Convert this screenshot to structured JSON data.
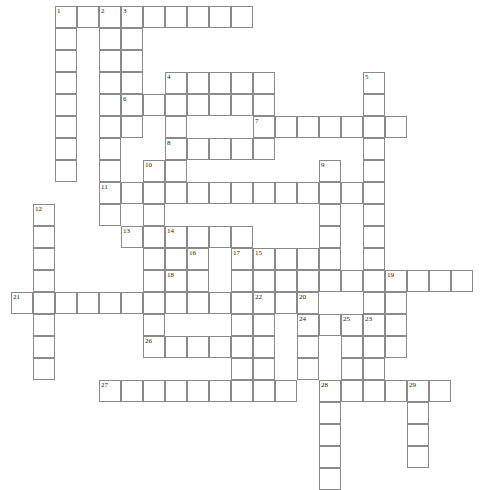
{
  "puzzle": {
    "title": "Crossword Puzzle Grid",
    "type": "crossword-grid",
    "grid": {
      "cell_size": 22,
      "origin_x": 11,
      "origin_y": 6,
      "columns": 22,
      "rows": 21,
      "border_color": "#8a8a8a",
      "cell_color": "#ffffff",
      "number_color": "#1a1a1a"
    },
    "entries": [
      {
        "number": 1,
        "direction": "down",
        "col": 2,
        "row": 0,
        "length": 8
      },
      {
        "number": 2,
        "direction": "down",
        "col": 4,
        "row": 0,
        "length": 9
      },
      {
        "number": 3,
        "direction": "across",
        "col": 5,
        "row": 0,
        "length": 6
      },
      {
        "number": 3,
        "direction": "down",
        "col": 5,
        "row": 0,
        "length": 6
      },
      {
        "number": 4,
        "direction": "across",
        "col": 7,
        "row": 3,
        "length": 5
      },
      {
        "number": 4,
        "direction": "down",
        "col": 7,
        "row": 3,
        "length": 5
      },
      {
        "number": 5,
        "direction": "down",
        "col": 16,
        "row": 3,
        "length": 12
      },
      {
        "number": 6,
        "direction": "across",
        "col": 5,
        "row": 4,
        "length": 7
      },
      {
        "number": 7,
        "direction": "across",
        "col": 11,
        "row": 5,
        "length": 7
      },
      {
        "number": 8,
        "direction": "across",
        "col": 7,
        "row": 6,
        "length": 5
      },
      {
        "number": 9,
        "direction": "down",
        "col": 14,
        "row": 7,
        "length": 6
      },
      {
        "number": 10,
        "direction": "down",
        "col": 6,
        "row": 7,
        "length": 8
      },
      {
        "number": 11,
        "direction": "across",
        "col": 4,
        "row": 8,
        "length": 12
      },
      {
        "number": 12,
        "direction": "down",
        "col": 1,
        "row": 9,
        "length": 7
      },
      {
        "number": 13,
        "direction": "across",
        "col": 5,
        "row": 10,
        "length": 3
      },
      {
        "number": 14,
        "direction": "across",
        "col": 7,
        "row": 10,
        "length": 4
      },
      {
        "number": 14,
        "direction": "down",
        "col": 7,
        "row": 10,
        "length": 3
      },
      {
        "number": 15,
        "direction": "down",
        "col": 11,
        "row": 11,
        "length": 9
      },
      {
        "number": 16,
        "direction": "down",
        "col": 8,
        "row": 11,
        "length": 3
      },
      {
        "number": 17,
        "direction": "down",
        "col": 10,
        "row": 11,
        "length": 8
      },
      {
        "number": 18,
        "direction": "across",
        "col": 7,
        "row": 12,
        "length": 2
      },
      {
        "number": 19,
        "direction": "across",
        "col": 17,
        "row": 12,
        "length": 4
      },
      {
        "number": 19,
        "direction": "down",
        "col": 17,
        "row": 12,
        "length": 4
      },
      {
        "number": 20,
        "direction": "down",
        "col": 13,
        "row": 13,
        "length": 4
      },
      {
        "number": 21,
        "direction": "across",
        "col": 0,
        "row": 13,
        "length": 10
      },
      {
        "number": 22,
        "direction": "across",
        "col": 11,
        "row": 13,
        "length": 3
      },
      {
        "number": 23,
        "direction": "down",
        "col": 16,
        "row": 14,
        "length": 5
      },
      {
        "number": 24,
        "direction": "across",
        "col": 13,
        "row": 14,
        "length": 2
      },
      {
        "number": 25,
        "direction": "across",
        "col": 15,
        "row": 14,
        "length": 2
      },
      {
        "number": 26,
        "direction": "across",
        "col": 6,
        "row": 15,
        "length": 5
      },
      {
        "number": 27,
        "direction": "across",
        "col": 4,
        "row": 17,
        "length": 9
      },
      {
        "number": 28,
        "direction": "across",
        "col": 14,
        "row": 17,
        "length": 4
      },
      {
        "number": 28,
        "direction": "down",
        "col": 14,
        "row": 17,
        "length": 5
      },
      {
        "number": 29,
        "direction": "across",
        "col": 18,
        "row": 17,
        "length": 2
      },
      {
        "number": 29,
        "direction": "down",
        "col": 18,
        "row": 17,
        "length": 4
      }
    ],
    "cells": [
      {
        "col": 2,
        "row": 0,
        "num": 1
      },
      {
        "col": 3,
        "row": 0
      },
      {
        "col": 4,
        "row": 0,
        "num": 2
      },
      {
        "col": 5,
        "row": 0,
        "num": 3
      },
      {
        "col": 6,
        "row": 0
      },
      {
        "col": 7,
        "row": 0
      },
      {
        "col": 8,
        "row": 0
      },
      {
        "col": 9,
        "row": 0
      },
      {
        "col": 10,
        "row": 0
      },
      {
        "col": 2,
        "row": 1
      },
      {
        "col": 4,
        "row": 1
      },
      {
        "col": 5,
        "row": 1
      },
      {
        "col": 2,
        "row": 2
      },
      {
        "col": 4,
        "row": 2
      },
      {
        "col": 5,
        "row": 2
      },
      {
        "col": 2,
        "row": 3
      },
      {
        "col": 4,
        "row": 3
      },
      {
        "col": 5,
        "row": 3
      },
      {
        "col": 7,
        "row": 3,
        "num": 4
      },
      {
        "col": 8,
        "row": 3
      },
      {
        "col": 9,
        "row": 3
      },
      {
        "col": 10,
        "row": 3
      },
      {
        "col": 11,
        "row": 3
      },
      {
        "col": 16,
        "row": 3,
        "num": 5
      },
      {
        "col": 2,
        "row": 4
      },
      {
        "col": 4,
        "row": 4
      },
      {
        "col": 5,
        "row": 4,
        "num": 6
      },
      {
        "col": 6,
        "row": 4
      },
      {
        "col": 7,
        "row": 4
      },
      {
        "col": 8,
        "row": 4
      },
      {
        "col": 9,
        "row": 4
      },
      {
        "col": 10,
        "row": 4
      },
      {
        "col": 11,
        "row": 4
      },
      {
        "col": 16,
        "row": 4
      },
      {
        "col": 2,
        "row": 5
      },
      {
        "col": 4,
        "row": 5
      },
      {
        "col": 5,
        "row": 5
      },
      {
        "col": 7,
        "row": 5
      },
      {
        "col": 11,
        "row": 5,
        "num": 7
      },
      {
        "col": 12,
        "row": 5
      },
      {
        "col": 13,
        "row": 5
      },
      {
        "col": 14,
        "row": 5
      },
      {
        "col": 15,
        "row": 5
      },
      {
        "col": 16,
        "row": 5
      },
      {
        "col": 17,
        "row": 5
      },
      {
        "col": 2,
        "row": 6
      },
      {
        "col": 4,
        "row": 6
      },
      {
        "col": 7,
        "row": 6,
        "num": 8
      },
      {
        "col": 8,
        "row": 6
      },
      {
        "col": 9,
        "row": 6
      },
      {
        "col": 10,
        "row": 6
      },
      {
        "col": 11,
        "row": 6
      },
      {
        "col": 16,
        "row": 6
      },
      {
        "col": 2,
        "row": 7
      },
      {
        "col": 4,
        "row": 7
      },
      {
        "col": 6,
        "row": 7,
        "num": 10
      },
      {
        "col": 7,
        "row": 7
      },
      {
        "col": 14,
        "row": 7,
        "num": 9
      },
      {
        "col": 16,
        "row": 7
      },
      {
        "col": 4,
        "row": 8,
        "num": 11
      },
      {
        "col": 5,
        "row": 8
      },
      {
        "col": 6,
        "row": 8
      },
      {
        "col": 7,
        "row": 8
      },
      {
        "col": 8,
        "row": 8
      },
      {
        "col": 9,
        "row": 8
      },
      {
        "col": 10,
        "row": 8
      },
      {
        "col": 11,
        "row": 8
      },
      {
        "col": 12,
        "row": 8
      },
      {
        "col": 13,
        "row": 8
      },
      {
        "col": 14,
        "row": 8
      },
      {
        "col": 15,
        "row": 8
      },
      {
        "col": 16,
        "row": 8
      },
      {
        "col": 1,
        "row": 9,
        "num": 12
      },
      {
        "col": 4,
        "row": 9
      },
      {
        "col": 6,
        "row": 9
      },
      {
        "col": 14,
        "row": 9
      },
      {
        "col": 16,
        "row": 9
      },
      {
        "col": 1,
        "row": 10
      },
      {
        "col": 5,
        "row": 10,
        "num": 13
      },
      {
        "col": 6,
        "row": 10
      },
      {
        "col": 7,
        "row": 10,
        "num": 14
      },
      {
        "col": 8,
        "row": 10
      },
      {
        "col": 9,
        "row": 10
      },
      {
        "col": 10,
        "row": 10
      },
      {
        "col": 14,
        "row": 10
      },
      {
        "col": 16,
        "row": 10
      },
      {
        "col": 1,
        "row": 11
      },
      {
        "col": 6,
        "row": 11
      },
      {
        "col": 7,
        "row": 11
      },
      {
        "col": 8,
        "row": 11,
        "num": 16
      },
      {
        "col": 10,
        "row": 11,
        "num": 17
      },
      {
        "col": 11,
        "row": 11,
        "num": 15
      },
      {
        "col": 12,
        "row": 11
      },
      {
        "col": 13,
        "row": 11
      },
      {
        "col": 14,
        "row": 11
      },
      {
        "col": 16,
        "row": 11
      },
      {
        "col": 1,
        "row": 12
      },
      {
        "col": 6,
        "row": 12
      },
      {
        "col": 7,
        "row": 12,
        "num": 18
      },
      {
        "col": 8,
        "row": 12
      },
      {
        "col": 10,
        "row": 12
      },
      {
        "col": 11,
        "row": 12
      },
      {
        "col": 12,
        "row": 12
      },
      {
        "col": 13,
        "row": 12
      },
      {
        "col": 14,
        "row": 12
      },
      {
        "col": 15,
        "row": 12
      },
      {
        "col": 16,
        "row": 12
      },
      {
        "col": 17,
        "row": 12,
        "num": 19
      },
      {
        "col": 18,
        "row": 12
      },
      {
        "col": 19,
        "row": 12
      },
      {
        "col": 20,
        "row": 12
      },
      {
        "col": 0,
        "row": 13,
        "num": 21
      },
      {
        "col": 1,
        "row": 13
      },
      {
        "col": 2,
        "row": 13
      },
      {
        "col": 3,
        "row": 13
      },
      {
        "col": 4,
        "row": 13
      },
      {
        "col": 5,
        "row": 13
      },
      {
        "col": 6,
        "row": 13
      },
      {
        "col": 7,
        "row": 13
      },
      {
        "col": 8,
        "row": 13
      },
      {
        "col": 9,
        "row": 13
      },
      {
        "col": 10,
        "row": 13
      },
      {
        "col": 11,
        "row": 13,
        "num": 22
      },
      {
        "col": 12,
        "row": 13
      },
      {
        "col": 13,
        "row": 13,
        "num": 20
      },
      {
        "col": 16,
        "row": 13
      },
      {
        "col": 17,
        "row": 13
      },
      {
        "col": 1,
        "row": 14
      },
      {
        "col": 6,
        "row": 14
      },
      {
        "col": 10,
        "row": 14
      },
      {
        "col": 11,
        "row": 14
      },
      {
        "col": 13,
        "row": 14,
        "num": 24
      },
      {
        "col": 14,
        "row": 14
      },
      {
        "col": 15,
        "row": 14,
        "num": 25
      },
      {
        "col": 16,
        "row": 14,
        "num": 23
      },
      {
        "col": 17,
        "row": 14
      },
      {
        "col": 1,
        "row": 15
      },
      {
        "col": 6,
        "row": 15,
        "num": 26
      },
      {
        "col": 7,
        "row": 15
      },
      {
        "col": 8,
        "row": 15
      },
      {
        "col": 9,
        "row": 15
      },
      {
        "col": 10,
        "row": 15
      },
      {
        "col": 11,
        "row": 15
      },
      {
        "col": 13,
        "row": 15
      },
      {
        "col": 15,
        "row": 15
      },
      {
        "col": 16,
        "row": 15
      },
      {
        "col": 17,
        "row": 15
      },
      {
        "col": 1,
        "row": 16
      },
      {
        "col": 10,
        "row": 16
      },
      {
        "col": 11,
        "row": 16
      },
      {
        "col": 13,
        "row": 16
      },
      {
        "col": 15,
        "row": 16
      },
      {
        "col": 16,
        "row": 16
      },
      {
        "col": 4,
        "row": 17,
        "num": 27
      },
      {
        "col": 5,
        "row": 17
      },
      {
        "col": 6,
        "row": 17
      },
      {
        "col": 7,
        "row": 17
      },
      {
        "col": 8,
        "row": 17
      },
      {
        "col": 9,
        "row": 17
      },
      {
        "col": 10,
        "row": 17
      },
      {
        "col": 11,
        "row": 17
      },
      {
        "col": 12,
        "row": 17
      },
      {
        "col": 14,
        "row": 17,
        "num": 28
      },
      {
        "col": 15,
        "row": 17
      },
      {
        "col": 16,
        "row": 17
      },
      {
        "col": 17,
        "row": 17
      },
      {
        "col": 18,
        "row": 17,
        "num": 29
      },
      {
        "col": 19,
        "row": 17
      },
      {
        "col": 14,
        "row": 18
      },
      {
        "col": 18,
        "row": 18
      },
      {
        "col": 14,
        "row": 19
      },
      {
        "col": 18,
        "row": 19
      },
      {
        "col": 14,
        "row": 20
      },
      {
        "col": 18,
        "row": 20
      },
      {
        "col": 14,
        "row": 21
      }
    ]
  }
}
